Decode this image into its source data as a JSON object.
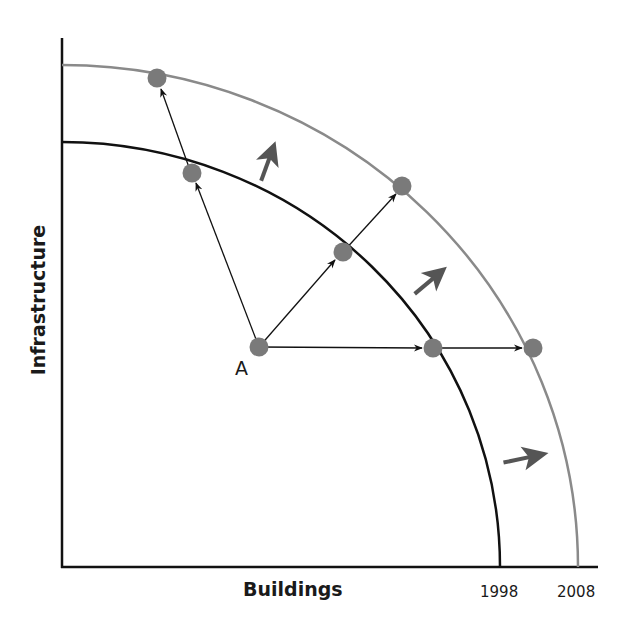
{
  "diagram": {
    "type": "production-possibilities-frontier",
    "axes": {
      "x_label": "Buildings",
      "y_label": "Infrastructure"
    },
    "curves": [
      {
        "name": "frontier-1998",
        "label": "1998",
        "color": "#111111"
      },
      {
        "name": "frontier-2008",
        "label": "2008",
        "color": "#8a8a8a"
      }
    ],
    "points": {
      "start_label": "A",
      "dot_color": "#7a7a7a"
    },
    "shift_arrow_color": "#555555"
  }
}
